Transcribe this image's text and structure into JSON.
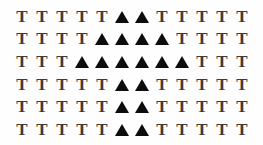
{
  "stimulus": {
    "title": "Visual Search Array",
    "description": "Grid of bold serif letter T distractors containing a triangle target cluster",
    "width": 263,
    "height": 145,
    "background_color": "#fefefe",
    "distractor_glyph": "T",
    "distractor_color": "#3b3b3b",
    "target_glyph": "▲",
    "target_name": "triangle",
    "target_color": "#0d0d0d",
    "columns": 12,
    "rows": 6,
    "total_cells": 72,
    "target_count": 18,
    "distractor_count": 54,
    "cell_types": [
      [
        "T",
        "T",
        "T",
        "T",
        "T",
        "triangle",
        "triangle",
        "T",
        "T",
        "T",
        "T",
        "T"
      ],
      [
        "T",
        "T",
        "T",
        "T",
        "triangle",
        "triangle",
        "triangle",
        "triangle",
        "T",
        "T",
        "T",
        "T"
      ],
      [
        "T",
        "T",
        "T",
        "triangle",
        "triangle",
        "triangle",
        "triangle",
        "triangle",
        "triangle",
        "T",
        "T",
        "T"
      ],
      [
        "T",
        "T",
        "T",
        "T",
        "T",
        "triangle",
        "triangle",
        "T",
        "T",
        "T",
        "T",
        "T"
      ],
      [
        "T",
        "T",
        "T",
        "T",
        "T",
        "triangle",
        "triangle",
        "T",
        "T",
        "T",
        "T",
        "T"
      ],
      [
        "T",
        "T",
        "T",
        "T",
        "T",
        "triangle",
        "triangle",
        "T",
        "T",
        "T",
        "T",
        "T"
      ]
    ],
    "row_labels": [
      "row-1",
      "row-2",
      "row-3",
      "row-4",
      "row-5",
      "row-6"
    ],
    "target_columns_per_row": [
      [
        6,
        7
      ],
      [
        5,
        6,
        7,
        8
      ],
      [
        4,
        5,
        6,
        7,
        8,
        9
      ],
      [
        6,
        7
      ],
      [
        6,
        7
      ],
      [
        6,
        7
      ]
    ]
  }
}
